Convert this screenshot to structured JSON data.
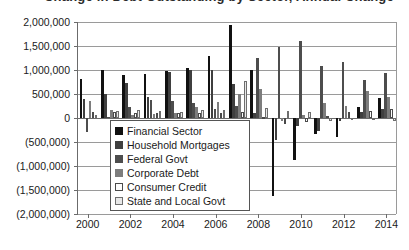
{
  "chart": {
    "title": "Change in Debt Outstanding by Sector, Annual Change",
    "type": "bar"
  },
  "yaxis": {
    "ticks": [
      "2,000,000",
      "1,500,000",
      "1,000,000",
      "500,000",
      "0",
      "(500,000)",
      "(1,000,000)",
      "(1,500,000)",
      "(2,000,000)"
    ]
  },
  "xaxis": {
    "ticks": [
      "2000",
      "2002",
      "2004",
      "2006",
      "2008",
      "2010",
      "2012",
      "2014"
    ]
  },
  "legend": {
    "items": [
      {
        "label": "Financial Sector",
        "color": "#111111"
      },
      {
        "label": "Household Mortgages",
        "color": "#3f3f3f"
      },
      {
        "label": "Federal Govt",
        "color": "#4d4d4d"
      },
      {
        "label": "Corporate Debt",
        "color": "#7d7d7d"
      },
      {
        "label": "Consumer Credit",
        "color": "#fdfdfd"
      },
      {
        "label": "State and Local Govt",
        "color": "#e8e8e8"
      }
    ]
  },
  "chart_data": {
    "type": "bar",
    "title": "Change in Debt Outstanding by Sector, Annual Change",
    "xlabel": "",
    "ylabel": "",
    "ylim": [
      -2000000,
      2000000
    ],
    "ytick_interval": 500000,
    "grid": true,
    "legend_position": "inside-center-left",
    "categories": [
      2000,
      2001,
      2002,
      2003,
      2004,
      2005,
      2006,
      2007,
      2008,
      2009,
      2010,
      2011,
      2012,
      2013,
      2014
    ],
    "series": [
      {
        "name": "Financial Sector",
        "color": "#111111",
        "values": [
          810000,
          1010000,
          890000,
          910000,
          980000,
          1050000,
          1300000,
          1940000,
          990000,
          -1620000,
          -880000,
          -330000,
          -390000,
          230000,
          420000
        ]
      },
      {
        "name": "Household Mortgages",
        "color": "#3f3f3f",
        "values": [
          390000,
          510000,
          720000,
          430000,
          960000,
          1010000,
          1010000,
          700000,
          110000,
          -460000,
          -170000,
          -270000,
          -65000,
          130000,
          190000
        ]
      },
      {
        "name": "Federal Govt",
        "color": "#4d4d4d",
        "values": [
          -290000,
          20000,
          230000,
          370000,
          350000,
          310000,
          190000,
          240000,
          1250000,
          1470000,
          1600000,
          1080000,
          1170000,
          790000,
          940000
        ]
      },
      {
        "name": "Corporate Debt",
        "color": "#7d7d7d",
        "values": [
          350000,
          170000,
          60000,
          90000,
          110000,
          230000,
          340000,
          490000,
          600000,
          -60000,
          70000,
          320000,
          250000,
          570000,
          440000
        ]
      },
      {
        "name": "Consumer Credit",
        "color": "#fdfdfd",
        "values": [
          130000,
          120000,
          110000,
          100000,
          110000,
          100000,
          100000,
          130000,
          30000,
          -120000,
          -90000,
          40000,
          120000,
          140000,
          180000
        ]
      },
      {
        "name": "State and Local Govt",
        "color": "#e8e8e8",
        "values": [
          60000,
          140000,
          160000,
          140000,
          120000,
          170000,
          160000,
          780000,
          200000,
          150000,
          130000,
          -60000,
          -50000,
          -40000,
          -60000
        ]
      }
    ]
  }
}
